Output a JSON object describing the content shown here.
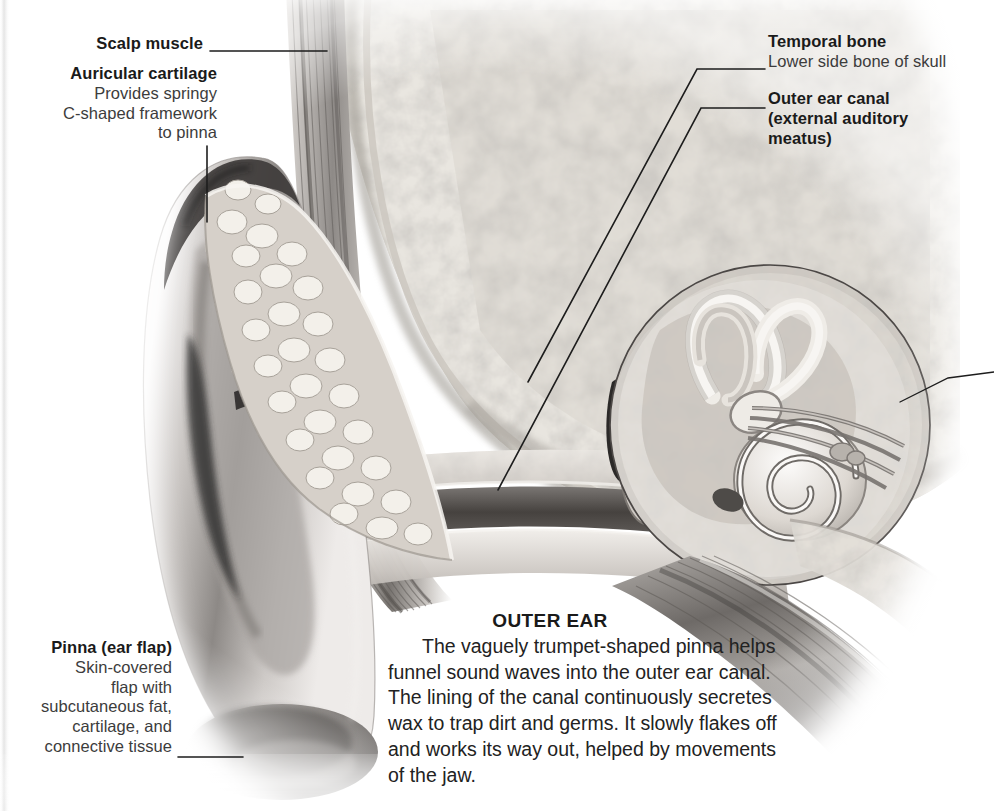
{
  "figure": {
    "title": "OUTER EAR"
  },
  "labels": [
    {
      "id": "scalp-muscle",
      "heading": "Scalp muscle",
      "sub": "",
      "align": "right",
      "x": 203,
      "y": 36
    },
    {
      "id": "auricular-cartilage",
      "heading": "Auricular cartilage",
      "sub": "Provides springy\nC-shaped framework\nto pinna",
      "align": "right",
      "x": 217,
      "y": 66
    },
    {
      "id": "temporal-bone",
      "heading": "Temporal bone",
      "sub": "Lower side bone of skull",
      "align": "left",
      "x": 769,
      "y": 33
    },
    {
      "id": "outer-ear-canal",
      "heading": "Outer ear canal\n(external auditory\nmeatus)",
      "sub": "",
      "align": "left",
      "x": 769,
      "y": 90
    },
    {
      "id": "pinna-ear-flap",
      "heading": "Pinna (ear flap)",
      "sub": "Skin-covered\nflap with\nsubcutaneous fat,\ncartilage, and\nconnective tissue",
      "align": "right",
      "x": 172,
      "y": 640
    }
  ],
  "label_text": {
    "scalp_muscle_heading": "Scalp muscle",
    "auricular_cartilage_heading": "Auricular cartilage",
    "auricular_cartilage_l1": "Provides springy",
    "auricular_cartilage_l2": "C-shaped framework",
    "auricular_cartilage_l3": "to pinna",
    "temporal_bone_heading": "Temporal bone",
    "temporal_bone_sub": "Lower side bone of skull",
    "outer_ear_canal_l1": "Outer ear canal",
    "outer_ear_canal_l2": "(external auditory",
    "outer_ear_canal_l3": "meatus)",
    "pinna_heading": "Pinna (ear flap)",
    "pinna_l1": "Skin-covered",
    "pinna_l2": "flap with",
    "pinna_l3": "subcutaneous fat,",
    "pinna_l4": "cartilage, and",
    "pinna_l5": "connective tissue"
  },
  "caption": {
    "title": "OUTER EAR",
    "body": "The vaguely trumpet-shaped pinna helps funnel sound waves into the outer ear canal. The lining of the canal continuously secretes wax to trap dirt and germs. It slowly flakes off and works its way out, helped by movements of the jaw."
  },
  "leaders": [
    {
      "id": "scalp-muscle-leader",
      "points": "210,51 327,51"
    },
    {
      "id": "auricular-cartilage-leader",
      "points": "207,146 207,222"
    },
    {
      "id": "temporal-bone-leader",
      "points": "765,69 697,69 528,382"
    },
    {
      "id": "outer-ear-canal-leader",
      "points": "765,108 701,108 498,490"
    },
    {
      "id": "magnifier-leader",
      "points": "900,402 948,378 994,372"
    },
    {
      "id": "pinna-leader",
      "points": "178,757 243,757"
    }
  ],
  "colors": {
    "ink": "#231f20",
    "label_sub": "#3c3c3c",
    "leader": "#1d1d1d",
    "paper": "#ffffff",
    "bone_light": "#efece6",
    "bone_mid": "#cfcac1",
    "bone_dark": "#9a958c",
    "muscle": "#8e8a86",
    "skin_light": "#e8e4e0",
    "skin_dark": "#6f6b68",
    "canal_dark": "#4a4746"
  },
  "anatomy_parts": [
    {
      "name": "pinna",
      "note": "trumpet-shaped ear flap, left of frame"
    },
    {
      "name": "auricular-cartilage",
      "note": "nodular C-shaped framework inside pinna"
    },
    {
      "name": "scalp-muscle",
      "note": "vertical striated band at top"
    },
    {
      "name": "temporal-bone",
      "note": "porous cancellous bone filling upper right"
    },
    {
      "name": "outer-ear-canal",
      "note": "tube running from pinna to eardrum"
    },
    {
      "name": "eardrum",
      "note": "oval membrane at inner end of canal"
    },
    {
      "name": "ossicles",
      "note": "malleus, incus and stapes in middle ear cavity"
    },
    {
      "name": "semicircular-canals",
      "note": "loops inside magnifier circle"
    },
    {
      "name": "cochlea",
      "note": "spiral inside magnifier circle"
    },
    {
      "name": "magnifier-circle",
      "note": "circular inset around inner ear, centre 770,425 radius 160"
    },
    {
      "name": "jaw-muscles",
      "note": "striated bands running to lower right"
    }
  ]
}
